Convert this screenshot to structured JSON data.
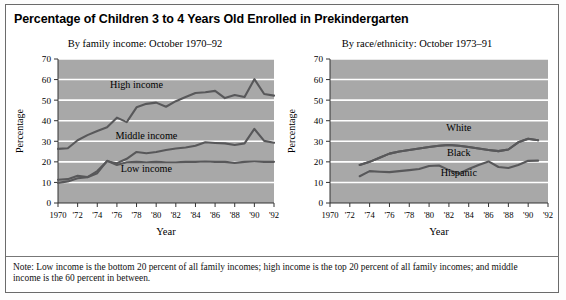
{
  "page": {
    "title": "Percentage of Children 3 to 4 Years Old Enrolled in Prekindergarten",
    "note": "Note: Low income is the bottom 20 percent of all family incomes; high income is the top 20 percent of all family incomes; and middle income is the 60 percent in between."
  },
  "panels": {
    "left": {
      "subtitle": "By family income: October 1970–92",
      "xlabel": "Year",
      "ylabel": "Percentage"
    },
    "right": {
      "subtitle": "By race/ethnicity: October 1973–91",
      "xlabel": "Year",
      "ylabel": "Percentage"
    }
  },
  "chart_data": [
    {
      "type": "line",
      "title": "Percentage of Children 3 to 4 Years Old Enrolled in Prekindergarten",
      "subtitle": "By family income: October 1970–92",
      "xlabel": "Year",
      "ylabel": "Percentage",
      "xlim": [
        1970,
        1992
      ],
      "ylim": [
        0,
        70
      ],
      "ytick_values": [
        0,
        10,
        20,
        30,
        40,
        50,
        60,
        70
      ],
      "ytick_labels": [
        "0",
        "10",
        "20",
        "30",
        "40",
        "50",
        "60",
        "70"
      ],
      "xtick_values": [
        1970,
        1972,
        1974,
        1976,
        1978,
        1980,
        1982,
        1984,
        1986,
        1988,
        1990,
        1992
      ],
      "xtick_labels": [
        "1970",
        "'72",
        "'74",
        "'76",
        "'78",
        "'80",
        "'82",
        "'84",
        "'86",
        "'88",
        "'90",
        "'92"
      ],
      "grid": "horizontal-white",
      "plot_background": "#a8a8a8",
      "line_color": "#58585a",
      "legend": "inline-annotations",
      "x": [
        1970,
        1971,
        1972,
        1973,
        1974,
        1975,
        1976,
        1977,
        1978,
        1979,
        1980,
        1981,
        1982,
        1983,
        1984,
        1985,
        1986,
        1987,
        1988,
        1989,
        1990,
        1991,
        1992
      ],
      "series": [
        {
          "name": "High income",
          "label_x": 1978,
          "label_y": 56,
          "values": [
            26.3,
            26.6,
            30.5,
            33.0,
            35.0,
            36.8,
            41.5,
            39.3,
            46.5,
            48.2,
            48.8,
            46.8,
            49.5,
            51.5,
            53.5,
            53.8,
            54.5,
            51.0,
            52.5,
            51.5,
            60.2,
            53.0,
            52.2
          ]
        },
        {
          "name": "Middle income",
          "label_x": 1979,
          "label_y": 31,
          "values": [
            11.3,
            11.6,
            13.2,
            12.6,
            15.5,
            20.3,
            19.3,
            21.5,
            24.8,
            24.2,
            24.8,
            25.8,
            26.5,
            27.0,
            27.8,
            29.5,
            29.2,
            29.0,
            28.2,
            29.0,
            36.0,
            30.2,
            29.3
          ]
        },
        {
          "name": "Low income",
          "label_x": 1979,
          "label_y": 15,
          "values": [
            9.8,
            10.5,
            12.0,
            12.5,
            14.5,
            20.5,
            18.5,
            19.8,
            20.0,
            19.8,
            20.0,
            19.8,
            19.8,
            20.0,
            20.0,
            20.2,
            20.0,
            20.0,
            19.5,
            20.0,
            20.2,
            20.0,
            20.0
          ]
        }
      ]
    },
    {
      "type": "line",
      "title": "Percentage of Children 3 to 4 Years Old Enrolled in Prekindergarten",
      "subtitle": "By race/ethnicity: October 1973–91",
      "xlabel": "Year",
      "ylabel": "Percentage",
      "xlim": [
        1970,
        1992
      ],
      "ylim": [
        0,
        70
      ],
      "ytick_values": [
        0,
        10,
        20,
        30,
        40,
        50,
        60,
        70
      ],
      "ytick_labels": [
        "0",
        "10",
        "20",
        "30",
        "40",
        "50",
        "60",
        "70"
      ],
      "xtick_values": [
        1970,
        1972,
        1974,
        1976,
        1978,
        1980,
        1982,
        1984,
        1986,
        1988,
        1990,
        1992
      ],
      "xtick_labels": [
        "1970",
        "'72",
        "'74",
        "'76",
        "'78",
        "'80",
        "'82",
        "'84",
        "'86",
        "'88",
        "'90",
        "'92"
      ],
      "grid": "horizontal-white",
      "plot_background": "#a8a8a8",
      "line_color": "#58585a",
      "legend": "inline-annotations",
      "x": [
        1973,
        1974,
        1975,
        1976,
        1977,
        1978,
        1979,
        1980,
        1981,
        1982,
        1983,
        1984,
        1985,
        1986,
        1987,
        1988,
        1989,
        1990,
        1991
      ],
      "series": [
        {
          "name": "White",
          "label_x": 1983,
          "label_y": 35,
          "values": [
            18.5,
            20.0,
            22.0,
            24.0,
            25.0,
            25.8,
            26.5,
            27.2,
            27.8,
            28.2,
            27.8,
            27.2,
            26.5,
            25.8,
            25.2,
            26.0,
            29.5,
            31.2,
            30.5
          ]
        },
        {
          "name": "Black",
          "label_x": 1983,
          "label_y": 23,
          "values": [
            18.5,
            20.0,
            22.0,
            24.0,
            25.0,
            25.8,
            26.5,
            27.2,
            27.8,
            28.2,
            27.8,
            27.2,
            26.5,
            25.8,
            25.2,
            26.0,
            29.5,
            31.2,
            30.5
          ]
        },
        {
          "name": "Hispanic",
          "label_x": 1983,
          "label_y": 13,
          "values": [
            13.0,
            15.5,
            15.2,
            15.0,
            15.5,
            16.0,
            16.5,
            18.0,
            18.2,
            16.0,
            14.2,
            16.5,
            18.5,
            20.2,
            17.5,
            17.0,
            18.5,
            20.5,
            20.6
          ]
        }
      ]
    }
  ]
}
